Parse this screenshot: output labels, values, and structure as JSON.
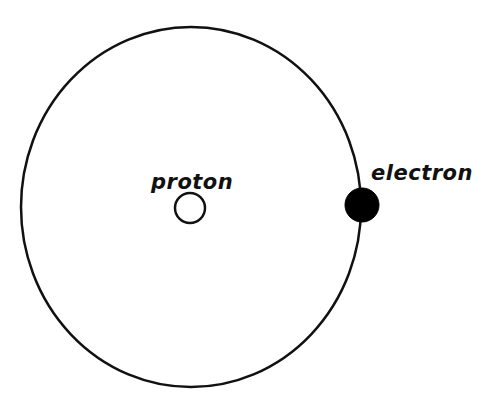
{
  "diagram": {
    "colors": {
      "background": "#ffffff",
      "stroke": "#111111",
      "electron_fill": "#000000",
      "proton_fill": "#ffffff"
    },
    "orbit": {
      "cx": 191,
      "cy": 207,
      "rx": 170,
      "ry": 180,
      "stroke_width": 2.5
    },
    "nodes": [
      {
        "id": "proton",
        "label": "proton",
        "shape": "circle",
        "filled": false,
        "cx": 190,
        "cy": 208,
        "r": 15
      },
      {
        "id": "electron",
        "label": "electron",
        "shape": "circle",
        "filled": true,
        "cx": 362,
        "cy": 205,
        "r": 17
      }
    ],
    "labels": {
      "proton": "proton",
      "electron": "electron"
    }
  }
}
